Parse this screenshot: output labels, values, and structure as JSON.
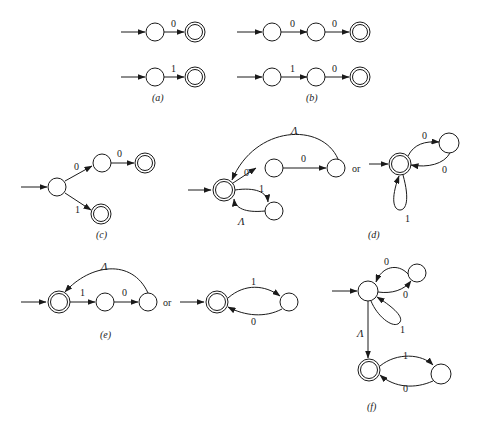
{
  "figure": {
    "parts": [
      {
        "id": "a",
        "caption": "(a)",
        "automata": [
          {
            "states": [
              "q0",
              "q1(accept)"
            ],
            "transitions": [
              [
                "q0",
                "q1",
                "0"
              ]
            ]
          },
          {
            "states": [
              "q0",
              "q1(accept)"
            ],
            "transitions": [
              [
                "q0",
                "q1",
                "1"
              ]
            ]
          }
        ]
      },
      {
        "id": "b",
        "caption": "(b)",
        "automata": [
          {
            "states": [
              "q0",
              "q1",
              "q2(accept)"
            ],
            "transitions": [
              [
                "q0",
                "q1",
                "0"
              ],
              [
                "q1",
                "q2",
                "0"
              ]
            ]
          },
          {
            "states": [
              "q0",
              "q1",
              "q2(accept)"
            ],
            "transitions": [
              [
                "q0",
                "q1",
                "1"
              ],
              [
                "q1",
                "q2",
                "0"
              ]
            ]
          }
        ]
      },
      {
        "id": "c",
        "caption": "(c)",
        "automata": [
          {
            "states": [
              "q0",
              "q1",
              "q2(accept)",
              "q3(accept)"
            ],
            "transitions": [
              [
                "q0",
                "q1",
                "0"
              ],
              [
                "q1",
                "q2",
                "0"
              ],
              [
                "q0",
                "q3",
                "1"
              ]
            ]
          }
        ]
      },
      {
        "id": "d",
        "caption": "(d)",
        "separator": "or",
        "automata": [
          {
            "states": [
              "q0(start,accept)",
              "q1",
              "q2",
              "q3"
            ],
            "transitions": [
              [
                "q0",
                "q1",
                "0"
              ],
              [
                "q1",
                "q2",
                "0"
              ],
              [
                "q2",
                "q0",
                "Λ"
              ],
              [
                "q0",
                "q3",
                "1"
              ],
              [
                "q3",
                "q0",
                "Λ"
              ]
            ]
          },
          {
            "states": [
              "q0(start,accept)",
              "q1"
            ],
            "transitions": [
              [
                "q0",
                "q1",
                "0"
              ],
              [
                "q1",
                "q0",
                "0"
              ],
              [
                "q0",
                "q0",
                "1"
              ]
            ]
          }
        ]
      },
      {
        "id": "e",
        "caption": "(e)",
        "separator": "or",
        "automata": [
          {
            "states": [
              "q0(start,accept)",
              "q1",
              "q2"
            ],
            "transitions": [
              [
                "q0",
                "q1",
                "1"
              ],
              [
                "q1",
                "q2",
                "0"
              ],
              [
                "q2",
                "q0",
                "Λ"
              ]
            ]
          },
          {
            "states": [
              "q0(start,accept)",
              "q1"
            ],
            "transitions": [
              [
                "q0",
                "q1",
                "1"
              ],
              [
                "q1",
                "q0",
                "0"
              ]
            ]
          }
        ]
      },
      {
        "id": "f",
        "caption": "(f)",
        "automata": [
          {
            "states": [
              "q0(start)",
              "q1",
              "q2(accept)",
              "q3"
            ],
            "transitions": [
              [
                "q0",
                "q1",
                "0"
              ],
              [
                "q1",
                "q0",
                "0"
              ],
              [
                "q0",
                "q0",
                "1"
              ],
              [
                "q0",
                "q2",
                "Λ"
              ],
              [
                "q2",
                "q3",
                "1"
              ],
              [
                "q3",
                "q2",
                "0"
              ]
            ]
          }
        ]
      }
    ]
  },
  "labels": {
    "zero": "0",
    "one": "1",
    "lambda": "Λ",
    "or": "or",
    "cap_a": "(a)",
    "cap_b": "(b)",
    "cap_c": "(c)",
    "cap_d": "(d)",
    "cap_e": "(e)",
    "cap_f": "(f)"
  }
}
